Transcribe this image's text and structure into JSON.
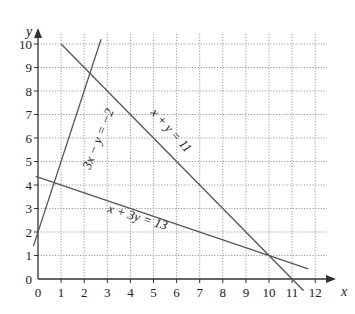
{
  "chart_data": {
    "type": "line",
    "title": "",
    "xlabel": "x",
    "ylabel": "y",
    "xlim": [
      0,
      12
    ],
    "ylim": [
      0,
      10
    ],
    "grid": true,
    "grid_style": "dotted",
    "x_ticks": [
      "0",
      "1",
      "2",
      "3",
      "4",
      "5",
      "6",
      "7",
      "8",
      "9",
      "10",
      "11",
      "12"
    ],
    "y_ticks": [
      "0",
      "1",
      "2",
      "3",
      "4",
      "5",
      "6",
      "7",
      "8",
      "9",
      "10"
    ],
    "series": [
      {
        "name": "3x − y = −2",
        "equation": "y = 3x + 2",
        "points": [
          [
            -0.2,
            1.4
          ],
          [
            2.73,
            10.2
          ]
        ]
      },
      {
        "name": "x + y = 11",
        "equation": "y = 11 − x",
        "points": [
          [
            1,
            10
          ],
          [
            11.5,
            -0.5
          ]
        ]
      },
      {
        "name": "x + 3y = 13",
        "equation": "y = (13 − x)/3",
        "points": [
          [
            -0.1,
            4.37
          ],
          [
            11.7,
            0.43
          ]
        ]
      }
    ],
    "intersections": [
      [
        1,
        4
      ],
      [
        3,
        8
      ],
      [
        10,
        1
      ]
    ],
    "legend": "none",
    "annotations": [
      "3x − y = −2",
      "x + y = 11",
      "x + 3y = 13"
    ]
  },
  "labels": {
    "x_axis": "x",
    "y_axis": "y",
    "eq1": "3x − y = −2",
    "eq2": "x + y = 11",
    "eq3": "x + 3y = 13"
  },
  "colors": {
    "line": "#555555",
    "grid": "#999999",
    "axis": "#333333"
  }
}
